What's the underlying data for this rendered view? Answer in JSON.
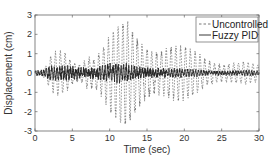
{
  "chart_data": {
    "type": "line",
    "title": "",
    "xlabel": "Time (sec)",
    "ylabel": "Displacement (cm)",
    "xlim": [
      0,
      30
    ],
    "ylim": [
      -3,
      3
    ],
    "xticks": [
      0,
      5,
      10,
      15,
      20,
      25,
      30
    ],
    "yticks": [
      -3,
      -2,
      -1,
      0,
      1,
      2,
      3
    ],
    "grid": false,
    "legend_position": "upper right",
    "series": [
      {
        "name": "Uncontrolled",
        "style": "dashed",
        "color": "#555555",
        "envelope_time": [
          0,
          1,
          1.5,
          2,
          3,
          4,
          5,
          6,
          7,
          8,
          9,
          10,
          11,
          12,
          13,
          14,
          15,
          16,
          17,
          18,
          20,
          22,
          25,
          28,
          30
        ],
        "envelope_amplitude": [
          0.1,
          0.2,
          0.4,
          0.8,
          1.2,
          1.2,
          0.8,
          0.8,
          1.4,
          1.3,
          1.5,
          2.0,
          2.2,
          2.7,
          2.6,
          2.4,
          2.3,
          2.0,
          1.8,
          1.6,
          1.3,
          1.1,
          0.8,
          0.6,
          0.4
        ]
      },
      {
        "name": "Fuzzy PID",
        "style": "solid",
        "color": "#222222",
        "envelope_time": [
          0,
          1,
          2,
          5,
          8,
          10,
          12,
          14,
          16,
          20,
          25,
          30
        ],
        "envelope_amplitude": [
          0.1,
          0.15,
          0.25,
          0.3,
          0.3,
          0.35,
          0.35,
          0.3,
          0.25,
          0.15,
          0.12,
          0.1
        ]
      }
    ]
  },
  "axes": {
    "xlabel": "Time (sec)",
    "ylabel": "Displacement (cm)",
    "xtick_labels": [
      "0",
      "5",
      "10",
      "15",
      "20",
      "25",
      "30"
    ],
    "ytick_labels": [
      "3",
      "2",
      "1",
      "0",
      "-1",
      "-2",
      "-3"
    ]
  },
  "legend": {
    "items": [
      {
        "label": "Uncontrolled"
      },
      {
        "label": "Fuzzy PID"
      }
    ]
  }
}
